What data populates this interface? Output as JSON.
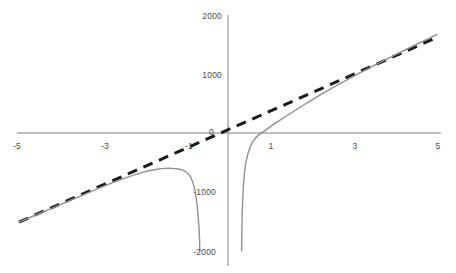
{
  "chart_data": {
    "type": "line",
    "title": "",
    "subtitle": "",
    "xlabel": "",
    "ylabel": "",
    "xlim": [
      -5,
      5
    ],
    "ylim": [
      -2000,
      2000
    ],
    "grid": false,
    "legend": "none",
    "x_ticks": [
      -5,
      -3,
      -1,
      1,
      3,
      5
    ],
    "x_tick_labels": [
      "-5",
      "-3",
      "-1",
      "1",
      "3",
      "5"
    ],
    "y_ticks": [
      -2000,
      -1000,
      0,
      1000,
      2000
    ],
    "y_tick_labels": [
      "-2000",
      "-1000",
      "0",
      "1000",
      "2000"
    ],
    "axes": {
      "x_axis_at_y": 0,
      "y_axis_at_x": 0,
      "color": "#808080"
    },
    "series": [
      {
        "name": "function",
        "style": "solid",
        "color": "#909090",
        "width": 1.4,
        "note": "gray solid curve with vertical asymptote near x = 0.5; left branch has local maximum near (-1.1, -620) then plunges to -2000 near x = -0.5; right branch rises from -2000 near x = 0.32, crosses zero near x = 0.82 and approaches the dashed asymptote from below",
        "branches": [
          {
            "name": "left-branch",
            "points": [
              [
                -5,
                -1510
              ],
              [
                -4.5,
                -1360
              ],
              [
                -4,
                -1210
              ],
              [
                -3.5,
                -1060
              ],
              [
                -3,
                -910
              ],
              [
                -2.6,
                -800
              ],
              [
                -2.2,
                -700
              ],
              [
                -1.9,
                -640
              ],
              [
                -1.7,
                -615
              ],
              [
                -1.5,
                -600
              ],
              [
                -1.35,
                -600
              ],
              [
                -1.2,
                -610
              ],
              [
                -1.1,
                -625
              ],
              [
                -1.0,
                -660
              ],
              [
                -0.92,
                -720
              ],
              [
                -0.85,
                -820
              ],
              [
                -0.8,
                -950
              ],
              [
                -0.76,
                -1110
              ],
              [
                -0.73,
                -1290
              ],
              [
                -0.71,
                -1460
              ],
              [
                -0.69,
                -1650
              ],
              [
                -0.68,
                -1830
              ],
              [
                -0.675,
                -2000
              ]
            ]
          },
          {
            "name": "right-branch",
            "points": [
              [
                0.325,
                -2000
              ],
              [
                0.33,
                -1700
              ],
              [
                0.34,
                -1380
              ],
              [
                0.355,
                -1080
              ],
              [
                0.375,
                -840
              ],
              [
                0.4,
                -640
              ],
              [
                0.44,
                -460
              ],
              [
                0.49,
                -320
              ],
              [
                0.55,
                -205
              ],
              [
                0.63,
                -110
              ],
              [
                0.72,
                -40
              ],
              [
                0.82,
                10
              ],
              [
                0.95,
                75
              ],
              [
                1.1,
                150
              ],
              [
                1.3,
                245
              ],
              [
                1.5,
                335
              ],
              [
                1.8,
                470
              ],
              [
                2.1,
                600
              ],
              [
                2.5,
                765
              ],
              [
                3.0,
                960
              ],
              [
                3.5,
                1145
              ],
              [
                4.0,
                1325
              ],
              [
                4.5,
                1500
              ],
              [
                5.0,
                1670
              ]
            ]
          }
        ]
      },
      {
        "name": "asymptote",
        "style": "dashed",
        "color": "#1a1a1a",
        "width": 3,
        "dash": "10 7",
        "note": "oblique asymptote, straight line through the origin",
        "points": [
          [
            -5,
            -1510
          ],
          [
            5,
            1620
          ]
        ]
      }
    ]
  },
  "labels": {
    "y_2000": "2000",
    "y_1000": "1000",
    "origin": "0",
    "y_neg1000": "-1000",
    "y_neg2000": "-2000",
    "x_neg5": "-5",
    "x_neg3": "-3",
    "x_neg1": "-1",
    "x_1": "1",
    "x_3": "3",
    "x_5": "5"
  },
  "colors": {
    "curve": "#909090",
    "asymptote": "#1a1a1a",
    "axis": "#808080",
    "text": "#4a4a4a",
    "background": "#ffffff"
  }
}
